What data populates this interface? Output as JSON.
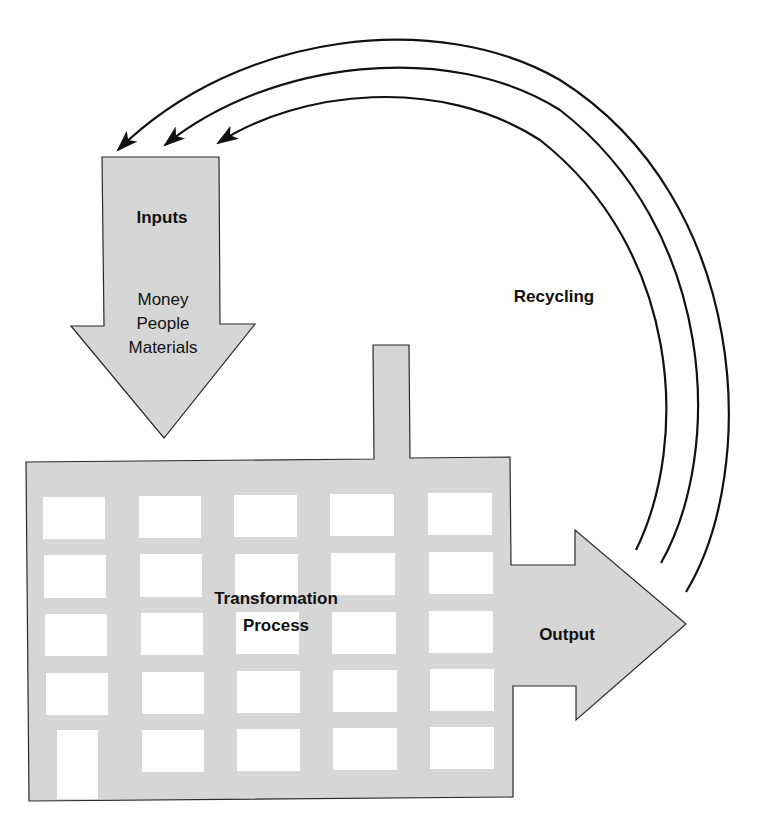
{
  "colors": {
    "shape_fill": "#d6d6d6",
    "window_fill": "#ffffff",
    "stroke": "#2a2a2a",
    "text": "#111111",
    "background": "#ffffff"
  },
  "inputs": {
    "title": "Inputs",
    "items": [
      "Money",
      "People",
      "Materials"
    ]
  },
  "process": {
    "line1": "Transformation",
    "line2": "Process"
  },
  "output": {
    "label": "Output"
  },
  "recycling": {
    "label": "Recycling",
    "arrow_count": 3
  }
}
